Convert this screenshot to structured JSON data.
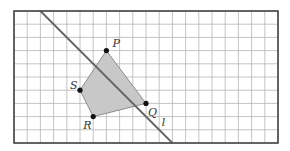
{
  "grid": {
    "origin_px": [
      14,
      11
    ],
    "cell_px": 13.2,
    "cols": 20,
    "rows": 10,
    "line_color": "#b5b5b5",
    "border_color": "#444444"
  },
  "points": [
    {
      "name": "P",
      "col": 7,
      "row": 3,
      "label_dx": 6,
      "label_dy": -4
    },
    {
      "name": "Q",
      "col": 10,
      "row": 7,
      "label_dx": 2,
      "label_dy": 13
    },
    {
      "name": "R",
      "col": 6,
      "row": 8,
      "label_dx": -10,
      "label_dy": 12
    },
    {
      "name": "S",
      "col": 5,
      "row": 6,
      "label_dx": -10,
      "label_dy": -1
    }
  ],
  "quadrilateral": {
    "vertices": [
      "P",
      "Q",
      "R",
      "S"
    ],
    "fill": "#c8c8c8",
    "stroke": "#777777"
  },
  "line_l": {
    "label": "l",
    "from": [
      2,
      0
    ],
    "to": [
      12,
      10
    ],
    "color": "#666666",
    "label_pos": [
      11.2,
      8.7
    ]
  }
}
